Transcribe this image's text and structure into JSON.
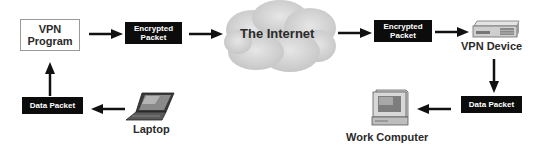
{
  "diagram": {
    "nodes": {
      "vpn_program": {
        "label_line1": "VPN",
        "label_line2": "Program"
      },
      "encrypted_packet_left": {
        "label_line1": "Encrypted",
        "label_line2": "Packet"
      },
      "internet": {
        "label": "The Internet"
      },
      "encrypted_packet_right": {
        "label_line1": "Encrypted",
        "label_line2": "Packet"
      },
      "vpn_device": {
        "label": "VPN Device",
        "icon": "network-device-icon"
      },
      "data_packet_right": {
        "label": "Data Packet"
      },
      "work_computer": {
        "label": "Work Computer",
        "icon": "desktop-computer-icon"
      },
      "data_packet_left": {
        "label": "Data Packet"
      },
      "laptop": {
        "label": "Laptop",
        "icon": "laptop-icon"
      }
    },
    "edges": [
      {
        "from": "laptop",
        "to": "data_packet_left",
        "direction": "left"
      },
      {
        "from": "data_packet_left",
        "to": "vpn_program",
        "direction": "up"
      },
      {
        "from": "vpn_program",
        "to": "encrypted_packet_left",
        "direction": "right"
      },
      {
        "from": "encrypted_packet_left",
        "to": "internet",
        "direction": "right"
      },
      {
        "from": "internet",
        "to": "encrypted_packet_right",
        "direction": "right"
      },
      {
        "from": "encrypted_packet_right",
        "to": "vpn_device",
        "direction": "right"
      },
      {
        "from": "vpn_device",
        "to": "data_packet_right",
        "direction": "down"
      },
      {
        "from": "data_packet_right",
        "to": "work_computer",
        "direction": "left"
      }
    ],
    "colors": {
      "packet_bg": "#0c0c0c",
      "packet_text": "#ffffff",
      "arrow": "#111111",
      "cloud": "#d4d4d4",
      "text": "#2a2a2a"
    }
  }
}
